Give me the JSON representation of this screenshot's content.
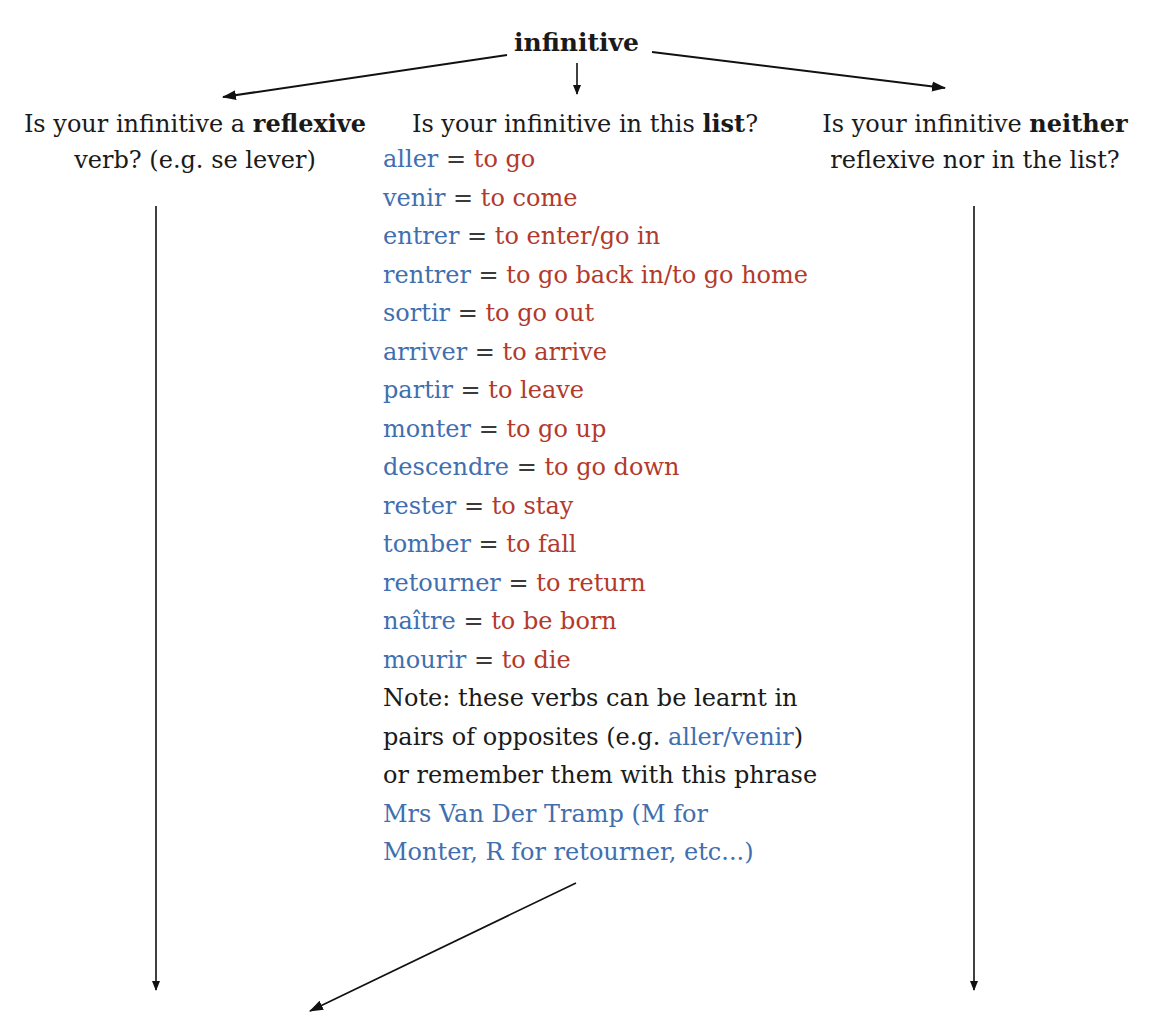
{
  "root": {
    "label": "infinitive"
  },
  "branches": {
    "left": {
      "line1_prefix": "Is your infinitive a ",
      "line1_bold": "reflexive",
      "line2": "verb? (e.g. se lever)"
    },
    "middle": {
      "prefix": "Is your infinitive in this ",
      "bold": "list",
      "suffix": "?"
    },
    "right": {
      "line1_prefix": "Is your infinitive ",
      "line1_bold": "neither",
      "line2": "reflexive nor in the list?"
    }
  },
  "verbs": [
    {
      "fr": "aller",
      "eq": "=",
      "en": "to go"
    },
    {
      "fr": "venir",
      "eq": "=",
      "en": "to come"
    },
    {
      "fr": "entrer",
      "eq": "=",
      "en": "to enter/go in"
    },
    {
      "fr": "rentrer",
      "eq": "=",
      "en": "to go back in/to go home"
    },
    {
      "fr": "sortir",
      "eq": "=",
      "en": "to go out"
    },
    {
      "fr": "arriver",
      "eq": "=",
      "en": "to arrive"
    },
    {
      "fr": "partir",
      "eq": "=",
      "en": "to leave"
    },
    {
      "fr": "monter",
      "eq": "=",
      "en": "to go up"
    },
    {
      "fr": "descendre",
      "eq": "=",
      "en": "to go down"
    },
    {
      "fr": "rester",
      "eq": "=",
      "en": "to stay"
    },
    {
      "fr": "tomber",
      "eq": "=",
      "en": "to fall"
    },
    {
      "fr": "retourner",
      "eq": "=",
      "en": "to return"
    },
    {
      "fr": "naître",
      "eq": "=",
      "en": "to be born"
    },
    {
      "fr": "mourir",
      "eq": "=",
      "en": "to die"
    }
  ],
  "note": {
    "line1": "Note: these verbs can be learnt in",
    "line2_prefix": "pairs of opposites (e.g. ",
    "line2_blue": "aller/venir",
    "line2_suffix": ")",
    "line3": "or remember them with this phrase",
    "line4": "Mrs Van Der Tramp (M for",
    "line5": "Monter, R for retourner, etc...)"
  },
  "colors": {
    "french": "#3f6faf",
    "english": "#b23a2c",
    "text": "#1a1a1a",
    "arrow": "#111111"
  }
}
